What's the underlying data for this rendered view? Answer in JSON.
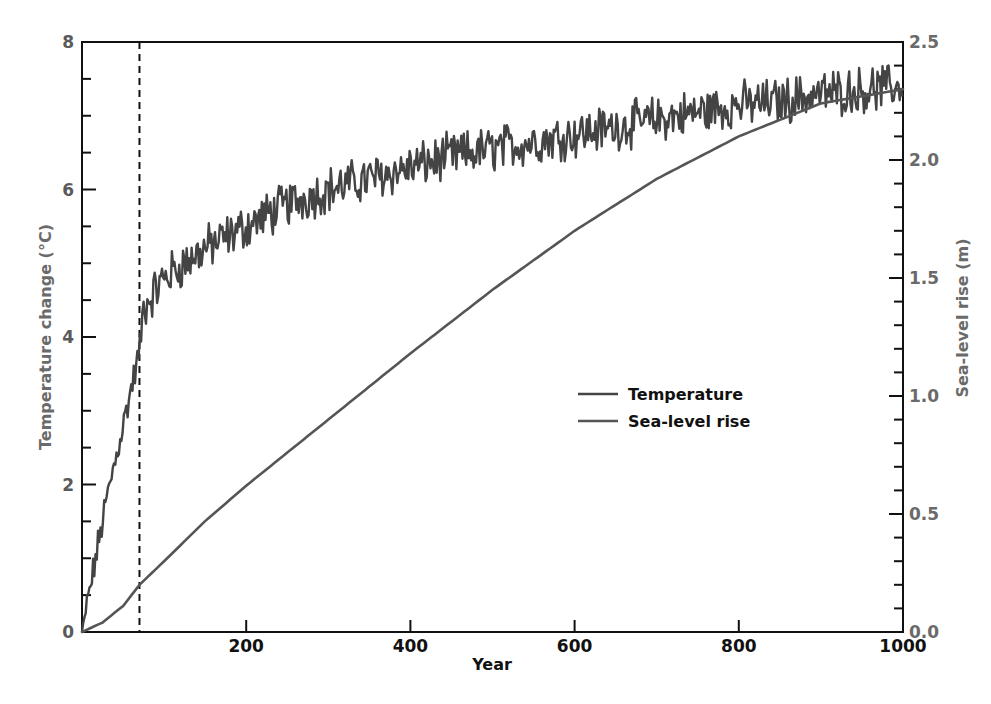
{
  "chart_data": {
    "type": "line",
    "title": "",
    "xlabel": "Year",
    "ylabel": "Temperature change (°C)",
    "ylabel_right": "Sea-level rise (m)",
    "xlim": [
      0,
      1000
    ],
    "ylim": [
      0,
      8
    ],
    "ylim_right": [
      0,
      2.5
    ],
    "x_ticks": [
      200,
      400,
      600,
      800,
      1000
    ],
    "x_tick_labels": [
      "200",
      "400",
      "600",
      "800",
      "1000"
    ],
    "y_ticks": [
      0,
      2,
      4,
      6,
      8
    ],
    "y_tick_labels": [
      "0",
      "2",
      "4",
      "6",
      "8"
    ],
    "y_ticks_right": [
      0.0,
      0.5,
      1.0,
      1.5,
      2.0,
      2.5
    ],
    "y_tick_labels_right": [
      "0.0",
      "0.5",
      "1.0",
      "1.5",
      "2.0",
      "2.5"
    ],
    "grid": false,
    "legend_position": "center-right",
    "annotations": [
      {
        "type": "vertical-dashed-line",
        "x": 70
      }
    ],
    "series": [
      {
        "name": "Temperature",
        "axis": "left",
        "color": "#444444",
        "x": [
          0,
          10,
          20,
          30,
          40,
          50,
          60,
          70,
          75,
          100,
          150,
          200,
          250,
          300,
          350,
          400,
          450,
          500,
          550,
          600,
          650,
          700,
          750,
          800,
          850,
          900,
          950,
          1000
        ],
        "values": [
          0,
          0.6,
          1.2,
          1.8,
          2.3,
          2.8,
          3.3,
          3.8,
          4.4,
          4.8,
          5.2,
          5.5,
          5.8,
          6.0,
          6.15,
          6.3,
          6.45,
          6.55,
          6.65,
          6.75,
          6.85,
          6.95,
          7.05,
          7.15,
          7.2,
          7.3,
          7.35,
          7.4
        ]
      },
      {
        "name": "Sea-level rise",
        "axis": "right",
        "color": "#555555",
        "x": [
          0,
          25,
          50,
          70,
          100,
          150,
          200,
          300,
          400,
          500,
          600,
          700,
          800,
          900,
          1000
        ],
        "values": [
          0,
          0.04,
          0.11,
          0.2,
          0.3,
          0.47,
          0.62,
          0.9,
          1.18,
          1.45,
          1.7,
          1.92,
          2.1,
          2.24,
          2.3
        ]
      }
    ]
  },
  "legend": {
    "items": [
      {
        "label": "Temperature"
      },
      {
        "label": "Sea-level rise"
      }
    ]
  },
  "axes": {
    "x_title": "Year",
    "y_left_title": "Temperature change (°C)",
    "y_right_title": "Sea-level rise (m)"
  },
  "colors": {
    "line": "#444444",
    "axis": "#111111",
    "left_label": "#5a5a5a",
    "right_label": "#6a6a6a"
  }
}
